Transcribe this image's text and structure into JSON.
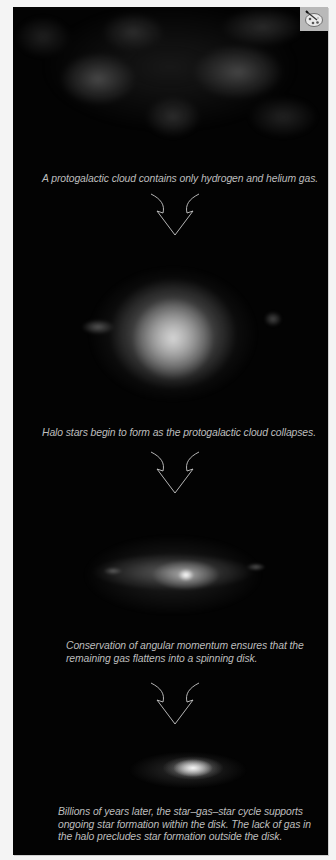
{
  "figure": {
    "badge": {
      "icon": "palette-brush-icon",
      "label": "Artwork"
    },
    "colors": {
      "background": "#f4f4f4",
      "panel": "#030303",
      "caption": "#bdbdbd",
      "arrow": "#c8c8c8",
      "badge": "#b9b9b9"
    },
    "stages": [
      {
        "image": "protogalactic-cloud",
        "caption": "A protogalactic cloud contains only hydrogen and helium gas."
      },
      {
        "image": "collapsing-cloud-halo-stars",
        "caption": "Halo stars begin to form as the protogalactic cloud collapses."
      },
      {
        "image": "flattening-spinning-disk",
        "caption_lines": [
          "Conservation of angular momentum ensures that the",
          "remaining gas flattens into a spinning disk."
        ]
      },
      {
        "image": "spiral-galaxy-disk",
        "caption_lines": [
          "Billions of years later, the star–gas–star cycle supports",
          "ongoing star formation within the disk. The lack of gas in",
          "the halo precludes star formation outside the disk."
        ]
      }
    ],
    "arrows": [
      "down-arrow",
      "down-arrow",
      "down-arrow"
    ]
  }
}
